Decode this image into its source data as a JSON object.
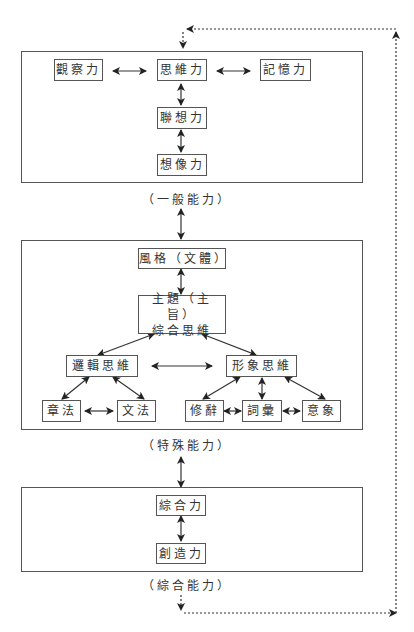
{
  "panels": {
    "general": {
      "caption": "（一般能力）",
      "nodes": {
        "observation": "觀察力",
        "thinking": "思維力",
        "memory": "記憶力",
        "association": "聯想力",
        "imagination": "想像力"
      }
    },
    "special": {
      "caption": "（特殊能力）",
      "nodes": {
        "style": "風格（文體）",
        "theme": "主題（主旨）\n綜合思維",
        "logical": "邏輯思維",
        "imagery_thinking": "形象思維",
        "structure": "章法",
        "grammar": "文法",
        "rhetoric": "修辭",
        "vocabulary": "詞彙",
        "imagery": "意象"
      }
    },
    "comprehensive": {
      "caption": "（綜合能力）",
      "nodes": {
        "synthesis": "綜合力",
        "creativity": "創造力"
      }
    }
  },
  "colors": {
    "line": "#333333",
    "border": "#555555"
  }
}
